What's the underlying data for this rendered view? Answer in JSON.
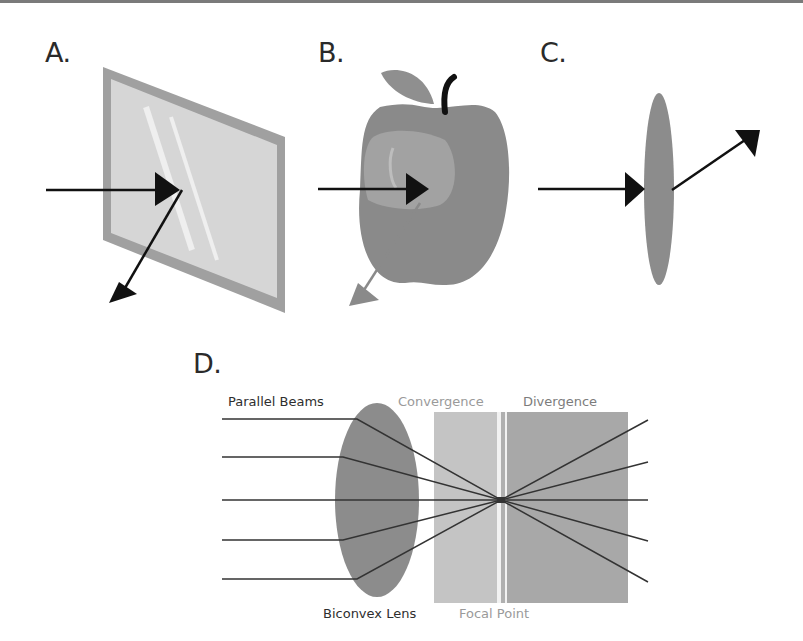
{
  "figure": {
    "panels": [
      {
        "id": "A",
        "label": "A.",
        "description": "Light ray reflecting off a flat mirror/glass pane"
      },
      {
        "id": "B",
        "label": "B.",
        "description": "Light ray striking an apple; partially reflected (gray arrow)"
      },
      {
        "id": "C",
        "label": "C.",
        "description": "Light ray passing through a thin lens and refracting"
      },
      {
        "id": "D",
        "label": "D.",
        "description": "Parallel beams converging through a biconvex lens to a focal point then diverging"
      }
    ],
    "panel_d": {
      "labels": {
        "parallel_beams": "Parallel Beams",
        "convergence": "Convergence",
        "divergence": "Divergence",
        "biconvex_lens": "Biconvex Lens",
        "focal_point": "Focal Point"
      },
      "beam_count": 5
    },
    "colors": {
      "arrow": "#111111",
      "mirror_frame": "#a0a0a0",
      "mirror_glass": "#d6d6d6",
      "apple": "#888888",
      "lens": "#8c8c8c",
      "convergence_zone": "#c4c4c4",
      "divergence_zone": "#a8a8a8",
      "beam": "#333333"
    }
  }
}
